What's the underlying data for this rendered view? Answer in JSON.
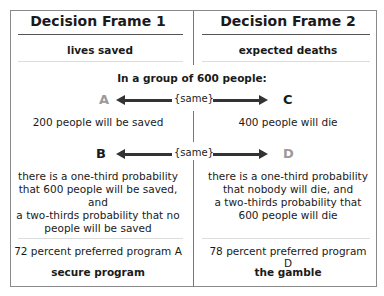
{
  "frames": [
    {
      "title": "Decision Frame 1",
      "subtitle": "lives saved",
      "option_top": {
        "letter": "A",
        "text": "200 people will be saved"
      },
      "option_bottom": {
        "letter": "B",
        "text_lines": [
          "there is a one-third probability",
          "that 600 people will be saved, and",
          "a two-thirds probability that no",
          "people will be saved"
        ]
      },
      "result": "72 percent preferred program A",
      "label": "secure program"
    },
    {
      "title": "Decision Frame 2",
      "subtitle": "expected deaths",
      "option_top": {
        "letter": "C",
        "text": "400 people will die"
      },
      "option_bottom": {
        "letter": "D",
        "text_lines": [
          "there is a one-third probability",
          "that nobody will die, and",
          "a two-thirds probability that",
          "600 people will die"
        ]
      },
      "result": "78 percent preferred program D",
      "label": "the gamble"
    }
  ],
  "shared": {
    "heading": "In a group of 600 people:",
    "same_label": "{same}"
  },
  "colors": {
    "emphasis_letter": "#1a1a1a",
    "muted_letter": "#9a9a9a",
    "border": "#8a8a8a"
  }
}
